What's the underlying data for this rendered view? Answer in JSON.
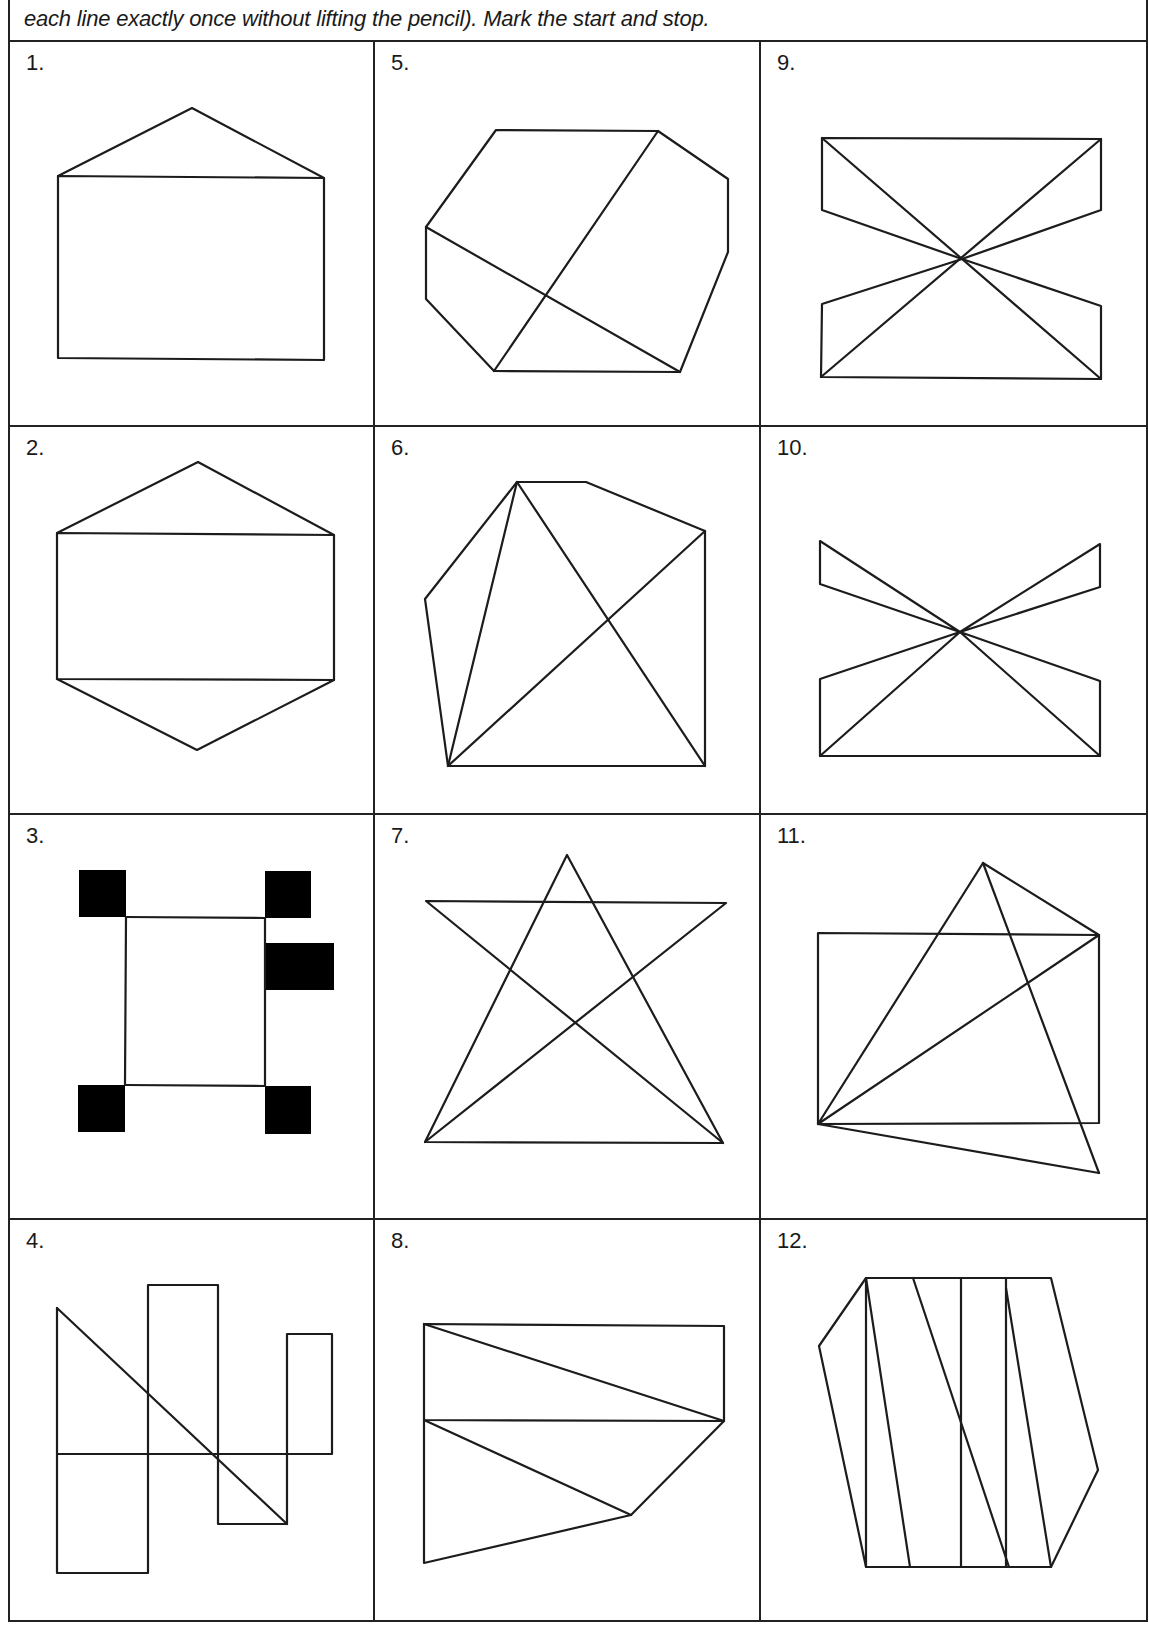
{
  "header": {
    "instruction_text": "each line exactly once without lifting the pencil). Mark the start and stop."
  },
  "grid": {
    "columns": 3,
    "rows": 4
  },
  "cells": [
    {
      "number": "1.",
      "figure": "house-shape"
    },
    {
      "number": "2.",
      "figure": "hexagon-with-rectangle"
    },
    {
      "number": "3.",
      "figure": "square-frame-with-corner-boxes"
    },
    {
      "number": "4.",
      "figure": "rectangles-with-diagonal"
    },
    {
      "number": "5.",
      "figure": "octagon-with-crossing-lines"
    },
    {
      "number": "6.",
      "figure": "pentagon-with-diagonals"
    },
    {
      "number": "7.",
      "figure": "star-in-triangle"
    },
    {
      "number": "8.",
      "figure": "rectangle-with-triangles"
    },
    {
      "number": "9.",
      "figure": "rectangle-hourglass"
    },
    {
      "number": "10.",
      "figure": "bowtie-hourglass"
    },
    {
      "number": "11.",
      "figure": "rectangle-with-kite"
    },
    {
      "number": "12.",
      "figure": "hexagon-with-zigzag"
    }
  ]
}
